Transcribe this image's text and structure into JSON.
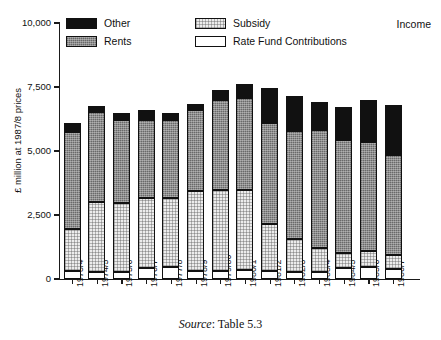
{
  "figure": {
    "income_label": "Income",
    "source_prefix": "Source",
    "source_text": ": Table 5.3"
  },
  "legend": {
    "items": [
      {
        "key": "other",
        "label": "Other",
        "color": "#111111"
      },
      {
        "key": "rents",
        "label": "Rents",
        "color": "#8d8d8d"
      },
      {
        "key": "subsidy",
        "label": "Subsidy",
        "color": "#ececec"
      },
      {
        "key": "rfc",
        "label": "Rate Fund Contributions",
        "color": "#ffffff"
      }
    ]
  },
  "chart_data": {
    "type": "bar",
    "stacked": true,
    "title": "Income",
    "xlabel": "",
    "ylabel": "£ million at 1987/8 prices",
    "ylim": [
      0,
      10000
    ],
    "yticks": [
      0,
      2500,
      5000,
      7500,
      10000
    ],
    "ytick_labels": [
      "0",
      "2,500",
      "5,000",
      "7,500",
      "10,000"
    ],
    "grid": false,
    "legend_position": "top-left",
    "categories": [
      "1973/4",
      "1974/5",
      "1975/6",
      "1976/7",
      "1977/8",
      "1978/9",
      "1979/80",
      "1980/1",
      "1981/2",
      "1982/3",
      "1983/4",
      "1984/5",
      "1985/6",
      "1986/7"
    ],
    "series": [
      {
        "name": "Rate Fund Contributions",
        "values": [
          300,
          260,
          280,
          420,
          480,
          300,
          330,
          350,
          300,
          290,
          260,
          430,
          470,
          380
        ]
      },
      {
        "name": "Subsidy",
        "values": [
          1650,
          2750,
          2700,
          2750,
          2700,
          3150,
          3150,
          3130,
          1830,
          1260,
          950,
          600,
          620,
          550
        ]
      },
      {
        "name": "Rents",
        "values": [
          3800,
          3500,
          3250,
          3050,
          3050,
          3150,
          3500,
          3600,
          3950,
          4250,
          4600,
          4400,
          4250,
          3900
        ]
      },
      {
        "name": "Other",
        "values": [
          350,
          250,
          250,
          400,
          250,
          250,
          400,
          520,
          1370,
          1350,
          1100,
          1300,
          1650,
          1950
        ]
      }
    ],
    "totals": [
      6100,
      6760,
      6480,
      6620,
      6480,
      6850,
      7380,
      7600,
      7450,
      7150,
      6910,
      6730,
      6990,
      6780
    ]
  }
}
